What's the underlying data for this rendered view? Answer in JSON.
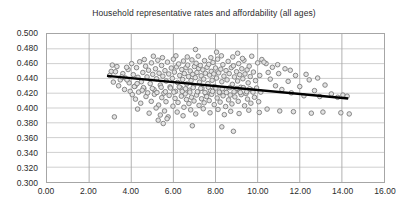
{
  "chart_data": {
    "type": "scatter",
    "title": "Household representative rates and affordability (all ages)",
    "xlabel": "",
    "ylabel": "",
    "xlim": [
      0.0,
      16.0
    ],
    "ylim": [
      0.3,
      0.5
    ],
    "xticks": [
      0.0,
      2.0,
      4.0,
      6.0,
      8.0,
      10.0,
      12.0,
      14.0,
      16.0
    ],
    "xtick_labels": [
      "0.00",
      "2.00",
      "4.00",
      "6.00",
      "8.00",
      "10.00",
      "12.00",
      "14.00",
      "16.00"
    ],
    "yticks": [
      0.3,
      0.32,
      0.34,
      0.36,
      0.38,
      0.4,
      0.42,
      0.44,
      0.46,
      0.48,
      0.5
    ],
    "ytick_labels": [
      "0.300",
      "0.320",
      "0.340",
      "0.360",
      "0.380",
      "0.400",
      "0.420",
      "0.440",
      "0.460",
      "0.480",
      "0.500"
    ],
    "grid": true,
    "grid_x": true,
    "grid_y": true,
    "legend": false,
    "legend_position": "none",
    "marker": {
      "shape": "circle-open",
      "size_px": 4.6,
      "fill": "#e3e3e3",
      "stroke": "#7a7a7a",
      "stroke_width": 0.9
    },
    "trendline": {
      "type": "linear",
      "color": "#000000",
      "width_px": 2.4,
      "x_start": 2.85,
      "y_start": 0.4435,
      "x_end": 14.3,
      "y_end": 0.4128
    },
    "series": [
      {
        "name": "Households",
        "points": [
          [
            3.05,
            0.4495
          ],
          [
            3.32,
            0.456
          ],
          [
            3.48,
            0.438
          ],
          [
            3.6,
            0.4465
          ],
          [
            3.72,
            0.4405
          ],
          [
            3.85,
            0.452
          ],
          [
            3.9,
            0.434
          ],
          [
            4.02,
            0.46
          ],
          [
            4.1,
            0.445
          ],
          [
            4.18,
            0.4295
          ],
          [
            4.25,
            0.4545
          ],
          [
            4.32,
            0.4415
          ],
          [
            4.4,
            0.4625
          ],
          [
            4.48,
            0.4355
          ],
          [
            4.55,
            0.448
          ],
          [
            4.6,
            0.426
          ],
          [
            4.68,
            0.4565
          ],
          [
            4.75,
            0.442
          ],
          [
            4.82,
            0.451
          ],
          [
            4.9,
            0.433
          ],
          [
            4.96,
            0.461
          ],
          [
            5.02,
            0.4455
          ],
          [
            5.08,
            0.425
          ],
          [
            5.15,
            0.453
          ],
          [
            5.2,
            0.4395
          ],
          [
            5.26,
            0.4645
          ],
          [
            5.32,
            0.447
          ],
          [
            5.38,
            0.431
          ],
          [
            5.44,
            0.4575
          ],
          [
            5.5,
            0.443
          ],
          [
            5.55,
            0.42
          ],
          [
            5.6,
            0.4505
          ],
          [
            5.66,
            0.4365
          ],
          [
            5.72,
            0.462
          ],
          [
            5.78,
            0.446
          ],
          [
            5.84,
            0.4285
          ],
          [
            5.9,
            0.454
          ],
          [
            5.95,
            0.44
          ],
          [
            6.0,
            0.466
          ],
          [
            6.05,
            0.4485
          ],
          [
            6.1,
            0.4225
          ],
          [
            6.15,
            0.4555
          ],
          [
            6.2,
            0.4345
          ],
          [
            6.25,
            0.4595
          ],
          [
            6.3,
            0.444
          ],
          [
            6.35,
            0.427
          ],
          [
            6.4,
            0.452
          ],
          [
            6.44,
            0.4385
          ],
          [
            6.48,
            0.4635
          ],
          [
            6.52,
            0.4465
          ],
          [
            6.56,
            0.419
          ],
          [
            6.6,
            0.4545
          ],
          [
            6.64,
            0.4325
          ],
          [
            6.68,
            0.458
          ],
          [
            6.72,
            0.4425
          ],
          [
            6.76,
            0.424
          ],
          [
            6.8,
            0.45
          ],
          [
            6.84,
            0.437
          ],
          [
            6.88,
            0.465
          ],
          [
            6.92,
            0.4455
          ],
          [
            6.96,
            0.43
          ],
          [
            7.0,
            0.456
          ],
          [
            7.04,
            0.441
          ],
          [
            7.08,
            0.4605
          ],
          [
            7.12,
            0.448
          ],
          [
            7.16,
            0.4215
          ],
          [
            7.2,
            0.4535
          ],
          [
            7.24,
            0.435
          ],
          [
            7.28,
            0.4575
          ],
          [
            7.32,
            0.4435
          ],
          [
            7.36,
            0.4265
          ],
          [
            7.4,
            0.4515
          ],
          [
            7.44,
            0.439
          ],
          [
            7.48,
            0.464
          ],
          [
            7.52,
            0.447
          ],
          [
            7.56,
            0.418
          ],
          [
            7.6,
            0.455
          ],
          [
            7.64,
            0.433
          ],
          [
            7.68,
            0.459
          ],
          [
            7.72,
            0.4445
          ],
          [
            7.76,
            0.4235
          ],
          [
            7.8,
            0.4495
          ],
          [
            7.84,
            0.4375
          ],
          [
            7.88,
            0.4615
          ],
          [
            7.92,
            0.446
          ],
          [
            7.96,
            0.429
          ],
          [
            8.0,
            0.454
          ],
          [
            8.05,
            0.4405
          ],
          [
            8.1,
            0.466
          ],
          [
            8.15,
            0.4475
          ],
          [
            8.2,
            0.4205
          ],
          [
            8.25,
            0.4525
          ],
          [
            8.3,
            0.4355
          ],
          [
            8.35,
            0.4585
          ],
          [
            8.4,
            0.443
          ],
          [
            8.45,
            0.4255
          ],
          [
            8.5,
            0.4505
          ],
          [
            8.55,
            0.438
          ],
          [
            8.6,
            0.463
          ],
          [
            8.65,
            0.4465
          ],
          [
            8.7,
            0.4175
          ],
          [
            8.75,
            0.4545
          ],
          [
            8.8,
            0.432
          ],
          [
            8.85,
            0.457
          ],
          [
            8.9,
            0.442
          ],
          [
            8.95,
            0.423
          ],
          [
            9.0,
            0.449
          ],
          [
            9.05,
            0.4365
          ],
          [
            9.1,
            0.46
          ],
          [
            9.15,
            0.445
          ],
          [
            9.2,
            0.428
          ],
          [
            9.25,
            0.453
          ],
          [
            9.3,
            0.4395
          ],
          [
            9.35,
            0.4645
          ],
          [
            9.4,
            0.446
          ],
          [
            9.45,
            0.4195
          ],
          [
            9.5,
            0.4515
          ],
          [
            9.55,
            0.434
          ],
          [
            9.6,
            0.4565
          ],
          [
            9.65,
            0.4425
          ],
          [
            9.7,
            0.4245
          ],
          [
            9.8,
            0.4485
          ],
          [
            9.9,
            0.437
          ],
          [
            10.0,
            0.461
          ],
          [
            10.1,
            0.444
          ],
          [
            4.2,
            0.412
          ],
          [
            4.45,
            0.4065
          ],
          [
            4.7,
            0.4155
          ],
          [
            4.95,
            0.409
          ],
          [
            5.1,
            0.4185
          ],
          [
            5.3,
            0.404
          ],
          [
            5.45,
            0.414
          ],
          [
            5.65,
            0.4085
          ],
          [
            5.8,
            0.417
          ],
          [
            5.98,
            0.4025
          ],
          [
            6.08,
            0.413
          ],
          [
            6.22,
            0.4075
          ],
          [
            6.38,
            0.416
          ],
          [
            6.5,
            0.401
          ],
          [
            6.62,
            0.4115
          ],
          [
            6.74,
            0.406
          ],
          [
            6.86,
            0.4145
          ],
          [
            6.98,
            0.4095
          ],
          [
            7.1,
            0.4175
          ],
          [
            7.22,
            0.4035
          ],
          [
            7.34,
            0.4125
          ],
          [
            7.46,
            0.407
          ],
          [
            7.58,
            0.4155
          ],
          [
            7.7,
            0.41
          ],
          [
            7.82,
            0.4185
          ],
          [
            7.94,
            0.4045
          ],
          [
            8.08,
            0.4135
          ],
          [
            8.22,
            0.408
          ],
          [
            8.36,
            0.4165
          ],
          [
            8.48,
            0.402
          ],
          [
            8.62,
            0.411
          ],
          [
            8.78,
            0.4055
          ],
          [
            8.92,
            0.415
          ],
          [
            9.08,
            0.409
          ],
          [
            9.22,
            0.418
          ],
          [
            9.38,
            0.403
          ],
          [
            9.52,
            0.412
          ],
          [
            9.68,
            0.4065
          ],
          [
            9.85,
            0.4145
          ],
          [
            10.05,
            0.4085
          ],
          [
            3.95,
            0.4225
          ],
          [
            4.15,
            0.429
          ],
          [
            4.35,
            0.4215
          ],
          [
            4.58,
            0.4275
          ],
          [
            4.78,
            0.4205
          ],
          [
            5.0,
            0.4265
          ],
          [
            5.22,
            0.421
          ],
          [
            5.42,
            0.428
          ],
          [
            5.62,
            0.422
          ],
          [
            5.86,
            0.427
          ],
          [
            6.02,
            0.4215
          ],
          [
            6.28,
            0.4285
          ],
          [
            6.42,
            0.4225
          ],
          [
            6.58,
            0.426
          ],
          [
            6.78,
            0.4215
          ],
          [
            6.94,
            0.4275
          ],
          [
            7.14,
            0.422
          ],
          [
            7.3,
            0.4265
          ],
          [
            7.5,
            0.421
          ],
          [
            7.66,
            0.428
          ],
          [
            7.86,
            0.4225
          ],
          [
            8.02,
            0.427
          ],
          [
            8.18,
            0.4215
          ],
          [
            8.32,
            0.426
          ],
          [
            8.52,
            0.421
          ],
          [
            8.68,
            0.4275
          ],
          [
            8.88,
            0.422
          ],
          [
            9.02,
            0.4265
          ],
          [
            9.18,
            0.421
          ],
          [
            9.32,
            0.4275
          ],
          [
            9.48,
            0.422
          ],
          [
            9.62,
            0.426
          ],
          [
            9.78,
            0.4215
          ],
          [
            9.95,
            0.427
          ],
          [
            10.15,
            0.4215
          ],
          [
            2.98,
            0.444
          ],
          [
            3.15,
            0.435
          ],
          [
            3.25,
            0.449
          ],
          [
            3.4,
            0.43
          ],
          [
            3.55,
            0.442
          ],
          [
            3.68,
            0.425
          ],
          [
            3.8,
            0.438
          ],
          [
            4.05,
            0.418
          ],
          [
            4.28,
            0.433
          ],
          [
            4.52,
            0.424
          ],
          [
            3.1,
            0.458
          ],
          [
            3.78,
            0.455
          ],
          [
            4.62,
            0.4655
          ],
          [
            5.05,
            0.47
          ],
          [
            5.48,
            0.468
          ],
          [
            6.12,
            0.4705
          ],
          [
            6.66,
            0.469
          ],
          [
            7.18,
            0.47
          ],
          [
            7.78,
            0.468
          ],
          [
            8.28,
            0.4705
          ],
          [
            8.82,
            0.469
          ],
          [
            9.28,
            0.467
          ],
          [
            9.72,
            0.47
          ],
          [
            10.2,
            0.4655
          ],
          [
            10.4,
            0.46
          ],
          [
            10.5,
            0.448
          ],
          [
            10.6,
            0.439
          ],
          [
            10.7,
            0.455
          ],
          [
            10.85,
            0.43
          ],
          [
            11.0,
            0.4465
          ],
          [
            11.15,
            0.425
          ],
          [
            11.3,
            0.453
          ],
          [
            11.45,
            0.436
          ],
          [
            11.6,
            0.4205
          ],
          [
            11.8,
            0.444
          ],
          [
            12.0,
            0.429
          ],
          [
            12.2,
            0.4165
          ],
          [
            12.45,
            0.438
          ],
          [
            12.7,
            0.4235
          ],
          [
            12.95,
            0.4155
          ],
          [
            13.2,
            0.431
          ],
          [
            13.5,
            0.419
          ],
          [
            13.8,
            0.4145
          ],
          [
            14.05,
            0.4175
          ],
          [
            14.25,
            0.416
          ],
          [
            10.3,
            0.462
          ],
          [
            10.95,
            0.4585
          ],
          [
            11.55,
            0.451
          ],
          [
            12.3,
            0.4455
          ],
          [
            12.85,
            0.4405
          ],
          [
            4.3,
            0.3985
          ],
          [
            4.85,
            0.393
          ],
          [
            5.18,
            0.4
          ],
          [
            5.38,
            0.3905
          ],
          [
            5.58,
            0.396
          ],
          [
            5.75,
            0.388
          ],
          [
            6.18,
            0.3945
          ],
          [
            6.46,
            0.3895
          ],
          [
            6.82,
            0.3975
          ],
          [
            7.06,
            0.392
          ],
          [
            7.42,
            0.399
          ],
          [
            7.74,
            0.3935
          ],
          [
            8.12,
            0.398
          ],
          [
            8.42,
            0.391
          ],
          [
            8.72,
            0.3955
          ],
          [
            9.12,
            0.3925
          ],
          [
            9.58,
            0.397
          ],
          [
            10.08,
            0.394
          ],
          [
            10.45,
            0.3985
          ],
          [
            11.05,
            0.396
          ],
          [
            11.7,
            0.395
          ],
          [
            12.55,
            0.393
          ],
          [
            13.1,
            0.3945
          ],
          [
            13.95,
            0.3935
          ],
          [
            14.35,
            0.392
          ],
          [
            3.2,
            0.388
          ],
          [
            5.28,
            0.3835
          ],
          [
            5.52,
            0.379
          ],
          [
            5.7,
            0.3855
          ],
          [
            6.9,
            0.376
          ],
          [
            8.3,
            0.3745
          ],
          [
            8.85,
            0.3685
          ],
          [
            7.05,
            0.479
          ],
          [
            8.05,
            0.4755
          ],
          [
            9.05,
            0.474
          ]
        ]
      }
    ]
  }
}
